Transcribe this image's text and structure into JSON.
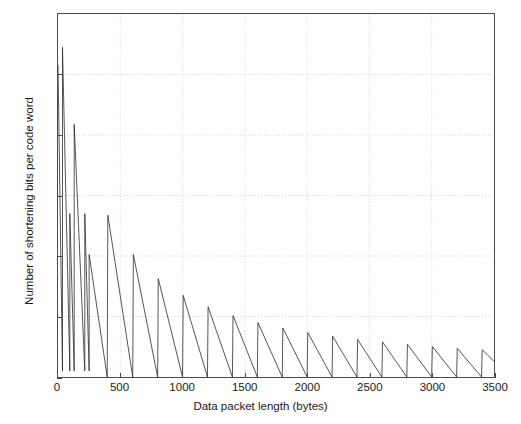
{
  "chart_data": {
    "type": "line",
    "title": "",
    "xlabel": "Data packet length (bytes)",
    "ylabel": "Number of shortening bits per code word",
    "xlim": [
      0,
      3500
    ],
    "ylim": [
      0,
      1200
    ],
    "xticks": [
      0,
      500,
      1000,
      1500,
      2000,
      2500,
      3000,
      3500
    ],
    "yticks": [
      0,
      200,
      400,
      600,
      800,
      1000,
      1200
    ],
    "xtick_labels": [
      "0",
      "500",
      "1000",
      "1500",
      "2000",
      "2500",
      "3000",
      "3500"
    ],
    "ytick_labels": [
      "0",
      "200",
      "400",
      "600",
      "800",
      "1000",
      "1200"
    ],
    "grid": true,
    "grid_style": "dotted",
    "grid_color": "#c8c8c8",
    "line_color": "#2b2b2b",
    "line_width": 0.8,
    "background": "#ffffff",
    "axis_color": "#4a4a4a",
    "legend": null,
    "series": [
      {
        "name": "shortening bits per code word",
        "points": [
          [
            0,
            1030
          ],
          [
            36,
            20
          ],
          [
            36,
            1090
          ],
          [
            95,
            20
          ],
          [
            95,
            540
          ],
          [
            130,
            20
          ],
          [
            130,
            835
          ],
          [
            215,
            20
          ],
          [
            215,
            540
          ],
          [
            250,
            20
          ],
          [
            250,
            405
          ],
          [
            395,
            0
          ],
          [
            400,
            535
          ],
          [
            600,
            0
          ],
          [
            605,
            405
          ],
          [
            800,
            0
          ],
          [
            805,
            325
          ],
          [
            1000,
            0
          ],
          [
            1005,
            270
          ],
          [
            1200,
            0
          ],
          [
            1205,
            232
          ],
          [
            1400,
            0
          ],
          [
            1405,
            203
          ],
          [
            1600,
            0
          ],
          [
            1605,
            180
          ],
          [
            1800,
            0
          ],
          [
            1805,
            162
          ],
          [
            2000,
            0
          ],
          [
            2005,
            147
          ],
          [
            2200,
            0
          ],
          [
            2205,
            135
          ],
          [
            2400,
            0
          ],
          [
            2405,
            124
          ],
          [
            2600,
            0
          ],
          [
            2605,
            116
          ],
          [
            2800,
            0
          ],
          [
            2805,
            108
          ],
          [
            3000,
            0
          ],
          [
            3005,
            101
          ],
          [
            3200,
            0
          ],
          [
            3205,
            95
          ],
          [
            3400,
            0
          ],
          [
            3405,
            90
          ],
          [
            3500,
            52
          ]
        ]
      }
    ]
  },
  "axes": {
    "y": {
      "ticks": [
        {
          "value": 0,
          "label": "0"
        },
        {
          "value": 200,
          "label": "200"
        },
        {
          "value": 400,
          "label": "400"
        },
        {
          "value": 600,
          "label": "600"
        },
        {
          "value": 800,
          "label": "800"
        },
        {
          "value": 1000,
          "label": "1000"
        },
        {
          "value": 1200,
          "label": "1200"
        }
      ]
    },
    "x": {
      "ticks": [
        {
          "value": 0,
          "label": "0"
        },
        {
          "value": 500,
          "label": "500"
        },
        {
          "value": 1000,
          "label": "1000"
        },
        {
          "value": 1500,
          "label": "1500"
        },
        {
          "value": 2000,
          "label": "2000"
        },
        {
          "value": 2500,
          "label": "2500"
        },
        {
          "value": 3000,
          "label": "3000"
        },
        {
          "value": 3500,
          "label": "3500"
        }
      ]
    }
  }
}
